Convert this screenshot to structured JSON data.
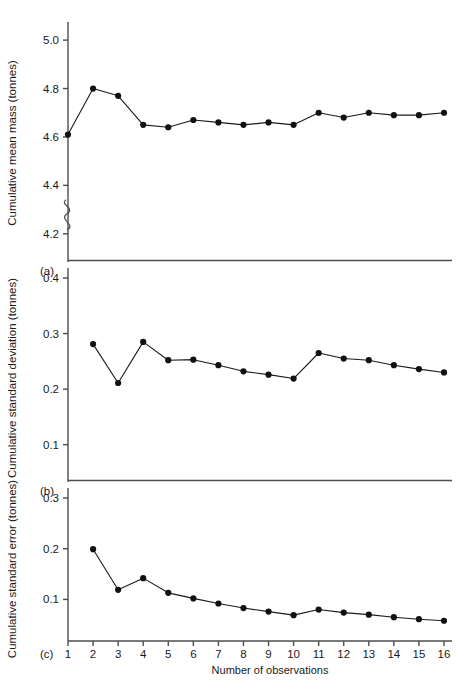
{
  "figure": {
    "x_axis_label": "Number of observations",
    "x_ticks": [
      "1",
      "2",
      "3",
      "4",
      "5",
      "6",
      "7",
      "8",
      "9",
      "10",
      "11",
      "12",
      "13",
      "14",
      "15",
      "16"
    ],
    "panel_a_label": "(a)",
    "panel_b_label": "(b)",
    "panel_c_label": "(c)",
    "axis_break_note": "axis break below 4.2 on panel (a)"
  },
  "chart_data": [
    {
      "type": "line",
      "panel": "(a)",
      "title": "",
      "xlabel": "Number of observations",
      "ylabel": "Cumulative mean mass (tonnes)",
      "x": [
        1,
        2,
        3,
        4,
        5,
        6,
        7,
        8,
        9,
        10,
        11,
        12,
        13,
        14,
        15,
        16
      ],
      "values": [
        4.61,
        4.8,
        4.77,
        4.65,
        4.64,
        4.67,
        4.66,
        4.65,
        4.66,
        4.65,
        4.7,
        4.68,
        4.7,
        4.69,
        4.69,
        4.7
      ],
      "xlim": [
        1,
        16
      ],
      "ylim": [
        4.1,
        5.05
      ],
      "y_ticks": [
        "5.0",
        "4.8",
        "4.6",
        "4.4",
        "4.2"
      ],
      "y_tick_values": [
        5.0,
        4.8,
        4.6,
        4.4,
        4.2
      ],
      "grid": false,
      "legend": "none",
      "marker": "filled-circle"
    },
    {
      "type": "line",
      "panel": "(b)",
      "title": "",
      "xlabel": "Number of observations",
      "ylabel": "Cumulative standard deviation (tonnes)",
      "x": [
        2,
        3,
        4,
        5,
        6,
        7,
        8,
        9,
        10,
        11,
        12,
        13,
        14,
        15,
        16
      ],
      "values": [
        0.281,
        0.211,
        0.285,
        0.252,
        0.253,
        0.243,
        0.232,
        0.226,
        0.219,
        0.265,
        0.255,
        0.252,
        0.243,
        0.236,
        0.23
      ],
      "xlim": [
        1,
        16
      ],
      "ylim": [
        0.04,
        0.4
      ],
      "y_ticks": [
        "0.4",
        "0.3",
        "0.2",
        "0.1"
      ],
      "y_tick_values": [
        0.4,
        0.3,
        0.2,
        0.1
      ],
      "grid": false,
      "legend": "none",
      "marker": "filled-circle"
    },
    {
      "type": "line",
      "panel": "(c)",
      "title": "",
      "xlabel": "Number of observations",
      "ylabel": "Cumulative standard error (tonnes)",
      "x": [
        2,
        3,
        4,
        5,
        6,
        7,
        8,
        9,
        10,
        11,
        12,
        13,
        14,
        15,
        16
      ],
      "values": [
        0.199,
        0.119,
        0.142,
        0.113,
        0.102,
        0.092,
        0.083,
        0.076,
        0.069,
        0.08,
        0.074,
        0.07,
        0.065,
        0.061,
        0.058
      ],
      "xlim": [
        1,
        16
      ],
      "ylim": [
        0.02,
        0.3
      ],
      "y_ticks": [
        "0.3",
        "0.2",
        "0.1"
      ],
      "y_tick_values": [
        0.3,
        0.2,
        0.1
      ],
      "grid": false,
      "legend": "none",
      "marker": "filled-circle"
    }
  ]
}
